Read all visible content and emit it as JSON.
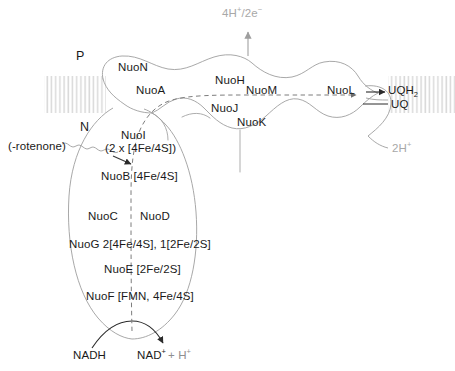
{
  "figure": {
    "compartments": {
      "positive_label": "P",
      "negative_label": "N"
    },
    "membrane": {
      "left_band_label": "lipid-bilayer-hatch",
      "right_band_label": "lipid-bilayer-hatch"
    },
    "proton_pumping": {
      "top_label": "4H",
      "top_label_sup": "+",
      "top_label_rest": "/2e",
      "top_label_rest_sup": "−"
    },
    "membrane_arm_subunits": [
      {
        "name": "NuoN"
      },
      {
        "name": "NuoA"
      },
      {
        "name": "NuoH"
      },
      {
        "name": "NuoM"
      },
      {
        "name": "NuoJ"
      },
      {
        "name": "NuoK"
      },
      {
        "name": "NuoL"
      }
    ],
    "peripheral_arm_subunits": [
      {
        "name": "NuoI",
        "cofactors": "(2 x [4Fe/4S])"
      },
      {
        "name": "NuoB [4Fe/4S]"
      },
      {
        "name": "NuoC"
      },
      {
        "name": "NuoD"
      },
      {
        "name": "NuoG 2[4Fe/4S], 1[2Fe/2S]"
      },
      {
        "name": "NuoE [2Fe/2S]"
      },
      {
        "name": "NuoF [FMN, 4Fe/4S]"
      }
    ],
    "inhibitor": {
      "label": "(-rotenone)"
    },
    "quinone": {
      "reduced": "UQH",
      "reduced_sub": "2",
      "oxidized": "UQ",
      "proton_uptake": "2H",
      "proton_uptake_sup": "+"
    },
    "substrate": {
      "donor": "NADH",
      "product": "NAD",
      "product_sup": "+",
      "product_rest": "+ H",
      "product_rest_sup": "+"
    },
    "colors": {
      "outline": "#9a9a9a",
      "membrane_hatch": "#e2e2e2",
      "text": "#1a1a1a",
      "faint_text": "#a8a8a8",
      "dashed_path": "#8a8a8a"
    }
  }
}
